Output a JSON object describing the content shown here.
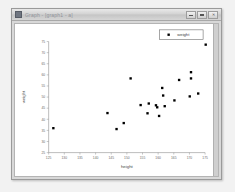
{
  "window": {
    "title": "Graph - [graph1 - a]",
    "icon_name": "app-icon",
    "buttons": {
      "minimize_label": "—",
      "maximize_label": "□",
      "close_label": "✕"
    }
  },
  "chart_data": {
    "type": "scatter",
    "title": "",
    "xlabel": "height",
    "ylabel": "weight",
    "xlim": [
      125,
      175
    ],
    "ylim": [
      25,
      75
    ],
    "xticks": [
      125,
      130,
      135,
      140,
      145,
      150,
      155,
      160,
      165,
      170,
      175
    ],
    "yticks": [
      25,
      30,
      35,
      40,
      45,
      50,
      55,
      60,
      65,
      70,
      75
    ],
    "grid": false,
    "legend_position": "top-right",
    "marker_color": "#000000",
    "marker_shape": "square",
    "series": [
      {
        "name": "weight",
        "points": [
          [
            126.5,
            36.0
          ],
          [
            143.8,
            42.8
          ],
          [
            146.7,
            35.6
          ],
          [
            149.0,
            38.3
          ],
          [
            151.2,
            58.4
          ],
          [
            154.4,
            46.4
          ],
          [
            156.6,
            42.7
          ],
          [
            157.0,
            47.1
          ],
          [
            159.3,
            46.3
          ],
          [
            159.7,
            45.4
          ],
          [
            160.3,
            41.5
          ],
          [
            161.3,
            54.1
          ],
          [
            161.6,
            50.7
          ],
          [
            162.1,
            45.9
          ],
          [
            165.2,
            48.5
          ],
          [
            166.7,
            57.7
          ],
          [
            170.1,
            50.3
          ],
          [
            170.5,
            58.4
          ],
          [
            170.5,
            61.2
          ],
          [
            172.8,
            51.6
          ],
          [
            175.2,
            73.6
          ]
        ]
      }
    ],
    "legend": [
      {
        "label": "weight",
        "color": "#000000"
      }
    ]
  }
}
